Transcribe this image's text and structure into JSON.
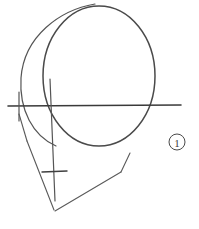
{
  "page": {
    "background_color": "#ffffff",
    "width": 199,
    "height": 229,
    "media": "pencil on paper"
  },
  "drawing": {
    "subject": "human head construction — side/three-quarter view",
    "description": "Loomis-style head construction: overlapping cranial sphere and ellipse, horizontal eye line, vertical center line, angular jaw meeting at a chin point, short mouth tick mark.",
    "ink_color": "#4a4a4a",
    "ink_color_dark": "#3a3a3a",
    "ink_color_light": "#6b6b6b",
    "strokes": [
      {
        "name": "cranial-sphere",
        "label": "Cranial sphere (main skull ball)",
        "type": "ellipse",
        "cx": 99,
        "cy": 76,
        "rx": 56,
        "ry": 70,
        "color": "#4a4a4a",
        "width": 1.5
      },
      {
        "name": "skull-side-plane-arc",
        "label": "Side plane / second overlapping arc",
        "type": "path",
        "d": "M 95 4 C 60 10, 24 36, 21 78 C 19 110, 33 136, 56 146",
        "color": "#555555",
        "width": 1.2
      },
      {
        "name": "eye-line",
        "label": "Horizontal eye / brow line",
        "type": "line",
        "x1": 8,
        "y1": 106,
        "x2": 181,
        "y2": 105,
        "color": "#3a3a3a",
        "width": 1.6
      },
      {
        "name": "center-line",
        "label": "Vertical center line of the face",
        "type": "line",
        "x1": 50,
        "y1": 79,
        "x2": 55,
        "y2": 201,
        "color": "#555555",
        "width": 1.2
      },
      {
        "name": "ear-tick-vertical",
        "label": "Short vertical tick at ear / back of jaw",
        "type": "line",
        "x1": 19,
        "y1": 92,
        "x2": 19,
        "y2": 121,
        "color": "#555555",
        "width": 1.2
      },
      {
        "name": "jaw-back-line",
        "label": "Back of jaw descending from ear point",
        "type": "line",
        "x1": 19,
        "y1": 114,
        "x2": 27,
        "y2": 141,
        "color": "#5a5a5a",
        "width": 1.1
      },
      {
        "name": "jaw-left-line",
        "label": "Left jaw line running to chin",
        "type": "line",
        "x1": 27,
        "y1": 141,
        "x2": 54,
        "y2": 210,
        "color": "#5a5a5a",
        "width": 1.1
      },
      {
        "name": "jaw-right-line",
        "label": "Right jaw line rising from chin",
        "type": "line",
        "x1": 55,
        "y1": 211,
        "x2": 121,
        "y2": 172,
        "color": "#5a5a5a",
        "width": 1.1
      },
      {
        "name": "jaw-right-upper-line",
        "label": "Upper segment of right jaw toward cheekbone",
        "type": "line",
        "x1": 121,
        "y1": 172,
        "x2": 130,
        "y2": 153,
        "color": "#5a5a5a",
        "width": 1.1
      },
      {
        "name": "mouth-tick",
        "label": "Short horizontal mouth line",
        "type": "line",
        "x1": 42,
        "y1": 172,
        "x2": 67,
        "y2": 171,
        "color": "#3f3f3f",
        "width": 1.4
      }
    ]
  },
  "annotations": {
    "step_marker": {
      "name": "step-1-marker",
      "label": "1",
      "shape": "circled numeral",
      "cx": 177,
      "cy": 142,
      "r": 8,
      "color": "#4a4a4a"
    }
  }
}
